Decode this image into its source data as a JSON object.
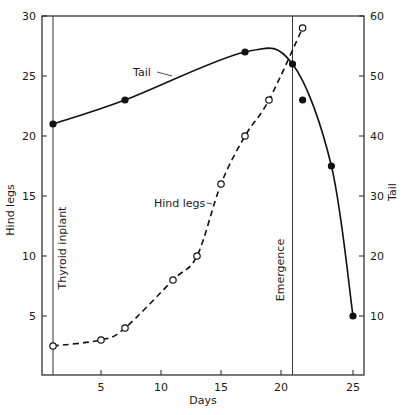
{
  "chart_data": {
    "type": "line",
    "title": "",
    "xlabel": "Days",
    "ylabel": "Hind legs",
    "ylabel_right": "Tail",
    "xlim": [
      0,
      26
    ],
    "ylim": [
      0,
      30
    ],
    "ylim_right": [
      0,
      60
    ],
    "x_ticks": [
      5,
      10,
      15,
      20,
      25
    ],
    "y_ticks": [
      5,
      10,
      15,
      20,
      25,
      30
    ],
    "y_ticks_right": [
      10,
      20,
      30,
      40,
      50,
      60
    ],
    "grid": false,
    "series": [
      {
        "name": "Tail",
        "axis": "right",
        "style": "solid",
        "marker": "filled-circle",
        "points": [
          [
            1,
            42
          ],
          [
            7,
            46
          ],
          [
            17,
            54
          ],
          [
            20.8,
            52
          ],
          [
            21.5,
            46
          ],
          [
            23.5,
            35
          ],
          [
            25,
            10
          ]
        ]
      },
      {
        "name": "Hind legs",
        "axis": "left",
        "style": "dashed",
        "marker": "open-circle",
        "points": [
          [
            1,
            2.5
          ],
          [
            5,
            3
          ],
          [
            7,
            4
          ],
          [
            11,
            8
          ],
          [
            13,
            10
          ],
          [
            15,
            16
          ],
          [
            17,
            20
          ],
          [
            19,
            23
          ],
          [
            21.5,
            29
          ]
        ]
      }
    ],
    "annotations": [
      {
        "text": "Thyroid inplant",
        "x": 1,
        "type": "vertical-line"
      },
      {
        "text": "Emergence",
        "x": 20.8,
        "type": "vertical-line"
      },
      {
        "text": "Tail",
        "type": "series-label"
      },
      {
        "text": "Hind legs",
        "type": "series-label"
      }
    ]
  },
  "labels": {
    "xlabel": "Days",
    "ylabel_left": "Hind legs",
    "ylabel_right": "Tail",
    "thyroid": "Thyroid inplant",
    "emergence": "Emergence",
    "tail_series": "Tail",
    "hind_series": "Hind legs",
    "x_ticks": [
      "5",
      "10",
      "15",
      "20",
      "25"
    ],
    "y_ticks_left": [
      "5",
      "10",
      "15",
      "20",
      "25",
      "30"
    ],
    "y_ticks_right": [
      "10",
      "20",
      "30",
      "40",
      "50",
      "60"
    ]
  }
}
